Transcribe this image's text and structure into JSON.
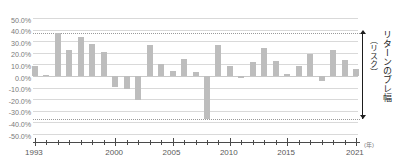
{
  "chart_data": {
    "type": "bar",
    "title": "",
    "xlabel": "(年)",
    "ylabel": "",
    "ylim": [
      -50,
      50
    ],
    "ytick_step": 10,
    "grid": true,
    "legend": false,
    "bar_color": "#bdbdbd",
    "categories": [
      1993,
      1994,
      1995,
      1996,
      1997,
      1998,
      1999,
      2000,
      2001,
      2002,
      2003,
      2004,
      2005,
      2006,
      2007,
      2008,
      2009,
      2010,
      2011,
      2012,
      2013,
      2014,
      2015,
      2016,
      2017,
      2018,
      2019,
      2020,
      2021
    ],
    "values": [
      9.0,
      0.8,
      37.0,
      22.2,
      33.2,
      28.0,
      20.4,
      -9.2,
      -11.2,
      -20.6,
      27.0,
      10.3,
      4.0,
      15.0,
      3.5,
      -37.0,
      26.4,
      8.8,
      -2.0,
      12.4,
      24.2,
      13.2,
      2.0,
      8.8,
      19.0,
      -4.0,
      22.6,
      13.4,
      5.8
    ],
    "ytick_labels": [
      "50.0%",
      "40.0%",
      "30.0%",
      "20.0%",
      "10.0%",
      "0.0%",
      "-10.0%",
      "-20.0%",
      "-30.0%",
      "-40.0%",
      "-50.0%"
    ],
    "ytick_values": [
      50,
      40,
      30,
      20,
      10,
      0,
      -10,
      -20,
      -30,
      -40,
      -50
    ],
    "xtick_labels": [
      {
        "year": 1993,
        "label": "1993"
      },
      {
        "year": 2000,
        "label": "2000"
      },
      {
        "year": 2005,
        "label": "2005"
      },
      {
        "year": 2010,
        "label": "2010"
      },
      {
        "year": 2015,
        "label": "2015"
      },
      {
        "year": 2021,
        "label": "2021"
      }
    ],
    "annotations": [
      {
        "name": "upper-reference-line",
        "value": 37.0,
        "style": "dotted"
      },
      {
        "name": "lower-reference-line",
        "value": -37.0,
        "style": "dotted"
      },
      {
        "name": "range-bracket",
        "from": -37.0,
        "to": 37.0,
        "label": "リターンのブレ幅（リスク）"
      }
    ]
  },
  "range_label": {
    "main": "リターンのブレ幅",
    "sub": "（リスク）"
  },
  "axis": {
    "x_unit": "(年)"
  }
}
